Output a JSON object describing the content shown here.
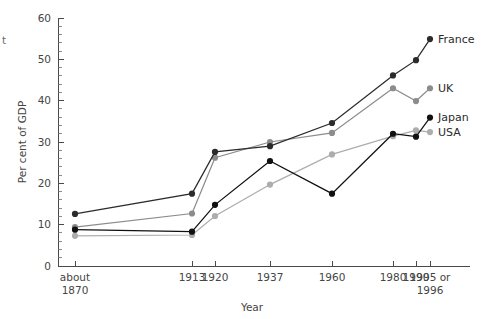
{
  "chart_data": {
    "type": "line",
    "title": "",
    "xlabel": "Year",
    "ylabel": "Per cent of GDP",
    "categories": [
      "about 1870",
      "1913",
      "1920",
      "1937",
      "1960",
      "1980",
      "1990",
      "1995 or 1996"
    ],
    "x_tick_labels_line1": [
      "about",
      "1913",
      "1920",
      "1937",
      "1960",
      "1980",
      "1990",
      "1995 or"
    ],
    "x_tick_labels_line2": [
      "1870",
      "",
      "",
      "",
      "",
      "",
      "",
      "1996"
    ],
    "ylim": [
      0,
      60
    ],
    "y_ticks": [
      0,
      10,
      20,
      30,
      40,
      50,
      60
    ],
    "y_minor_tick_step": 2,
    "grid": false,
    "legend_position": "right-inline",
    "series": [
      {
        "name": "France",
        "color": "#2b2b2b",
        "marker": "circle",
        "values": [
          12.6,
          17.5,
          27.6,
          29.0,
          34.6,
          46.1,
          49.8,
          54.9
        ]
      },
      {
        "name": "UK",
        "color": "#8c8c8c",
        "marker": "circle",
        "values": [
          9.4,
          12.7,
          26.2,
          30.0,
          32.2,
          43.0,
          39.9,
          43.0
        ]
      },
      {
        "name": "Japan",
        "color": "#111111",
        "marker": "circle",
        "values": [
          8.8,
          8.3,
          14.8,
          25.4,
          17.5,
          32.0,
          31.3,
          35.9
        ]
      },
      {
        "name": "USA",
        "color": "#adadad",
        "marker": "circle",
        "values": [
          7.3,
          7.5,
          12.1,
          19.7,
          27.0,
          31.4,
          32.8,
          32.4
        ]
      }
    ],
    "stray_margin_char": "t"
  }
}
